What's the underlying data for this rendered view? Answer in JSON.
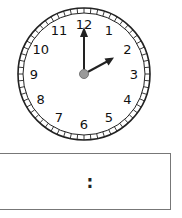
{
  "clock": {
    "numerals": [
      "12",
      "1",
      "2",
      "3",
      "4",
      "5",
      "6",
      "7",
      "8",
      "9",
      "10",
      "11"
    ],
    "hour_hand_points_to": 2,
    "minute_hand_points_to": 12,
    "colors": {
      "face": "#ffffff",
      "outline": "#222222",
      "hands": "#222222",
      "pivot": "#9a9a9a"
    }
  },
  "time_box": {
    "separator": ":"
  }
}
